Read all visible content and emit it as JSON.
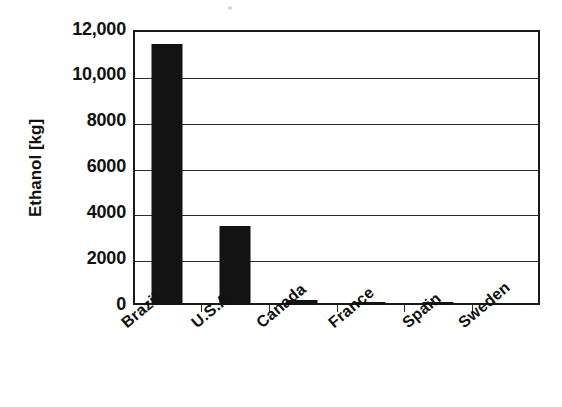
{
  "chart_data": {
    "type": "bar",
    "title": "",
    "subtitle": "",
    "xlabel": "",
    "ylabel": "Ethanol [kg]",
    "categories": [
      "Brazil",
      "U.S.A.",
      "Canada",
      "France",
      "Spain",
      "Sweden"
    ],
    "values": [
      11400,
      3450,
      220,
      140,
      150,
      20
    ],
    "series": [
      {
        "name": "Ethanol",
        "values": [
          11400,
          3450,
          220,
          140,
          150,
          20
        ]
      }
    ],
    "ylim": [
      0,
      12000
    ],
    "ytick_values": [
      0,
      2000,
      4000,
      6000,
      8000,
      10000,
      12000
    ],
    "ytick_labels": [
      "0",
      "2000",
      "4000",
      "6000",
      "8000",
      "10,000",
      "12,000"
    ],
    "grid": true,
    "grid_axis": "y",
    "legend": false,
    "legend_position": "none",
    "bar_color": "#131313",
    "axis_color": "#1a1a1a",
    "background_color": "#ffffff",
    "xlabel_rotation": -40
  },
  "axis": {
    "y_title": "Ethanol [kg]"
  }
}
